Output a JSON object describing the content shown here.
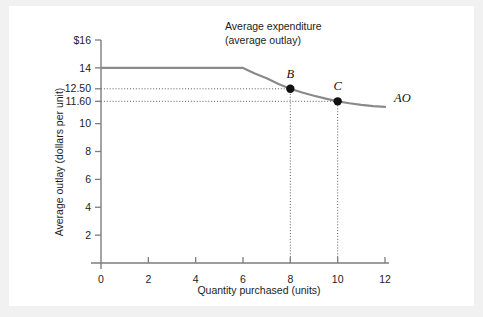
{
  "chart_data": {
    "type": "line",
    "title": "Average expenditure (average outlay)",
    "title_line1": "Average expenditure",
    "title_line2": "(average outlay)",
    "xlabel": "Quantity purchased (units)",
    "ylabel": "Average outlay (dollars per unit)",
    "xlim": [
      0,
      12
    ],
    "ylim": [
      0,
      16
    ],
    "grid": false,
    "legend_position": "none",
    "x_ticks": [
      "0",
      "2",
      "4",
      "6",
      "8",
      "10",
      "12"
    ],
    "x_tick_values": [
      0,
      2,
      4,
      6,
      8,
      10,
      12
    ],
    "y_ticks": [
      "2",
      "4",
      "6",
      "8",
      "10",
      "11.60",
      "12.50",
      "14",
      "$16"
    ],
    "y_tick_values": [
      2,
      4,
      6,
      8,
      10,
      11.6,
      12.5,
      14,
      16
    ],
    "series": [
      {
        "name": "AO",
        "label": "AO",
        "color": "#8a8a8a",
        "x": [
          0,
          1,
          2,
          3,
          4,
          5,
          6,
          6.5,
          7,
          7.5,
          8,
          8.5,
          9,
          9.5,
          10,
          10.5,
          11,
          11.5,
          12
        ],
        "values": [
          14,
          14,
          14,
          14,
          14,
          14,
          14,
          13.6,
          13.25,
          12.85,
          12.5,
          12.23,
          12.0,
          11.79,
          11.6,
          11.46,
          11.35,
          11.26,
          11.2
        ]
      }
    ],
    "annotations": [
      {
        "label": "B",
        "x": 8,
        "y": 12.5
      },
      {
        "label": "C",
        "x": 10,
        "y": 11.6
      }
    ],
    "guide_lines": [
      {
        "type": "horizontal",
        "y": 12.5,
        "from_x": 0,
        "to_x": 8
      },
      {
        "type": "horizontal",
        "y": 11.6,
        "from_x": 0,
        "to_x": 10
      },
      {
        "type": "vertical",
        "x": 8,
        "from_y": 0,
        "to_y": 12.5
      },
      {
        "type": "vertical",
        "x": 10,
        "from_y": 0,
        "to_y": 11.6
      }
    ],
    "colors": {
      "curve": "#8a8a8a",
      "marker": "#111111",
      "axis": "#7d7d7d",
      "text": "#1c1c1c",
      "background": "#ffffff",
      "outer_background": "#f1f1f1"
    }
  }
}
